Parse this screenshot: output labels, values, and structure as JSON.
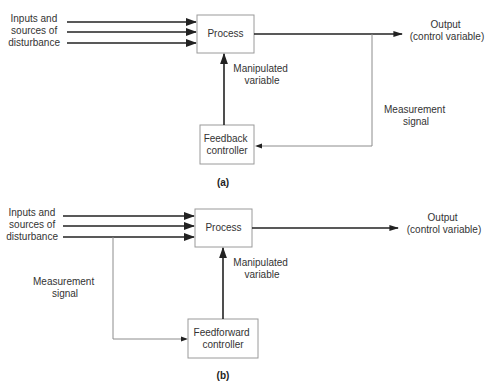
{
  "diagrams": {
    "a": {
      "caption": "(a)",
      "inputs_label": [
        "Inputs and",
        "sources of",
        "disturbance"
      ],
      "process_label": "Process",
      "output_label": [
        "Output",
        "(control variable)"
      ],
      "manipulated_label": [
        "Manipulated",
        "variable"
      ],
      "measurement_label": [
        "Measurement",
        "signal"
      ],
      "controller_label": [
        "Feedback",
        "controller"
      ]
    },
    "b": {
      "caption": "(b)",
      "inputs_label": [
        "Inputs and",
        "sources of",
        "disturbance"
      ],
      "process_label": "Process",
      "output_label": [
        "Output",
        "(control variable)"
      ],
      "manipulated_label": [
        "Manipulated",
        "variable"
      ],
      "measurement_label": [
        "Measurement",
        "signal"
      ],
      "controller_label": [
        "Feedforward",
        "controller"
      ]
    }
  },
  "colors": {
    "line_dark": "#222222",
    "line_light": "#8c8c8c",
    "box_border": "#9a9a9a",
    "text": "#333333"
  }
}
